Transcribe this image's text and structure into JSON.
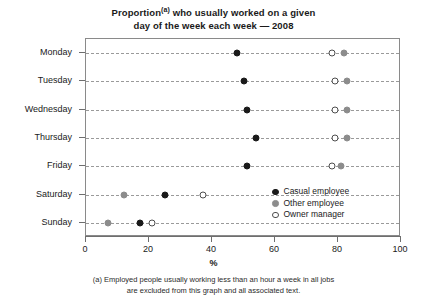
{
  "title": {
    "line1_before_sup": "Proportion",
    "superscript": "(a)",
    "line1_after_sup": " who usually worked on a given",
    "line2": "day of the week each week — 2008"
  },
  "axis": {
    "x_title": "%",
    "x_ticks": [
      "0",
      "20",
      "40",
      "60",
      "80",
      "100"
    ]
  },
  "legend": {
    "items": [
      {
        "label": "Casual employee",
        "color": "#1a1a1a",
        "style": "filled-black"
      },
      {
        "label": "Other employee",
        "color": "#8c8c8c",
        "style": "filled-gray"
      },
      {
        "label": "Owner manager",
        "color": "#ffffff",
        "style": "open"
      }
    ]
  },
  "footnote": {
    "line1": "(a) Employed people usually working less than an hour a week in all jobs",
    "line2": "are excluded from this graph and all associated text."
  },
  "chart_data": {
    "type": "scatter",
    "title": "Proportion(a) who usually worked on a given day of the week each week — 2008",
    "xlabel": "%",
    "ylabel": "",
    "xlim": [
      0,
      100
    ],
    "xticks": [
      0,
      20,
      40,
      60,
      80,
      100
    ],
    "grid": "horizontal-dashed",
    "legend_position": "inside-bottom-right",
    "categories": [
      "Monday",
      "Tuesday",
      "Wednesday",
      "Thursday",
      "Friday",
      "Saturday",
      "Sunday"
    ],
    "series": [
      {
        "name": "Casual employee",
        "color": "#1a1a1a",
        "values": [
          48,
          50,
          51,
          54,
          51,
          25,
          17
        ]
      },
      {
        "name": "Other employee",
        "color": "#8c8c8c",
        "values": [
          82,
          83,
          83,
          83,
          81,
          12,
          7
        ]
      },
      {
        "name": "Owner manager",
        "color": "#ffffff",
        "values": [
          78,
          79,
          79,
          79,
          78,
          37,
          21
        ]
      }
    ]
  }
}
